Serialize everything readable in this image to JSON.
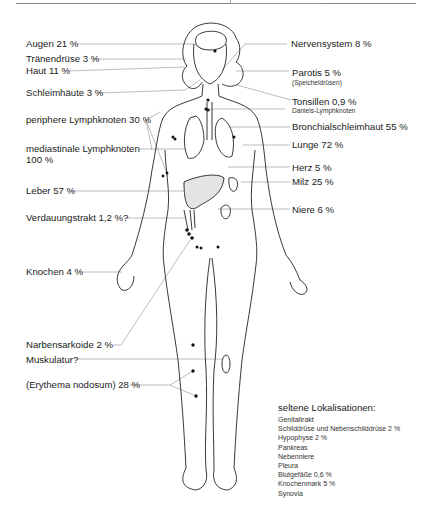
{
  "labels_left": [
    {
      "id": "augen",
      "text": "Augen 21 %"
    },
    {
      "id": "traenendruese",
      "text": "Tränendrüse 3 %"
    },
    {
      "id": "haut",
      "text": "Haut 11 %"
    },
    {
      "id": "schleimhaeute",
      "text": "Schleimhäute 3 %"
    },
    {
      "id": "periphere_lk",
      "text": "periphere Lymphknoten 30 %"
    },
    {
      "id": "mediastinale_lk",
      "text": "mediastinale  Lymphknoten"
    },
    {
      "id": "mediastinale_lk_pct",
      "text": "100 %"
    },
    {
      "id": "leber",
      "text": "Leber 57 %"
    },
    {
      "id": "verdauungstrakt",
      "text": "Verdauungstrakt 1,2 %?"
    },
    {
      "id": "knochen",
      "text": "Knochen 4 %"
    },
    {
      "id": "narbensarkoide",
      "text": "Narbensarkoide 2 %"
    },
    {
      "id": "muskulatur",
      "text": "Muskulatur?"
    },
    {
      "id": "erythema",
      "text": "(Erythema nodosum) 28 %"
    }
  ],
  "labels_right": [
    {
      "id": "nervensystem",
      "text": "Nervensystem 8 %"
    },
    {
      "id": "parotis",
      "text": "Parotis 5 %"
    },
    {
      "id": "parotis_sub",
      "text": "(Speicheldrüsen)"
    },
    {
      "id": "tonsillen",
      "text": "Tonsillen 0,9 %"
    },
    {
      "id": "tonsillen_sub",
      "text": "Daniels-Lymphknoten"
    },
    {
      "id": "bronchial",
      "text": "Bronchialschleimhaut 55 %"
    },
    {
      "id": "lunge",
      "text": "Lunge 72 %"
    },
    {
      "id": "herz",
      "text": "Herz 5 %"
    },
    {
      "id": "milz",
      "text": "Milz 25 %"
    },
    {
      "id": "niere",
      "text": "Niere 6 %"
    }
  ],
  "rare_localizations": {
    "title": "seltene Lokalisationen:",
    "items": [
      "Genitaltrakt",
      "Schilddrüse und Nebenschilddrüse 2 %",
      "Hypophyse 2 %",
      "Pankreas",
      "Nebenniere",
      "Pleura",
      "Blutgefäße 0,6 %",
      "Knochenmark 5 %",
      "Synovia"
    ]
  },
  "colors": {
    "line": "#9a9a9a",
    "outline": "#222222",
    "text": "#222222",
    "organ_fill": "#d9d9d9"
  }
}
